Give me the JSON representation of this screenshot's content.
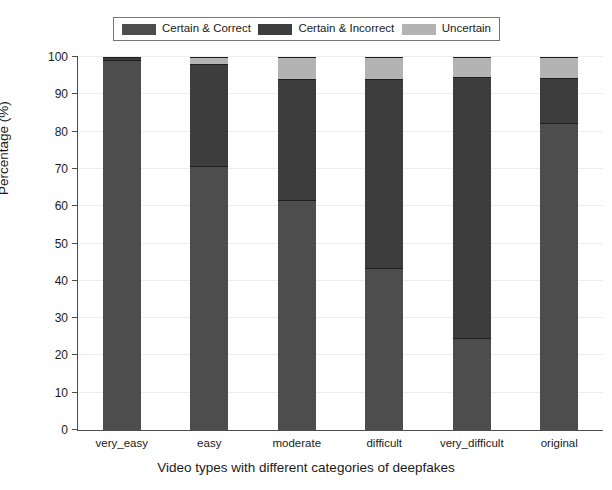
{
  "chart_data": {
    "type": "bar",
    "bar_mode": "stacked",
    "title": "",
    "xlabel": "Video types with different categories of deepfakes",
    "ylabel": "Percentage (%)",
    "categories": [
      "very_easy",
      "easy",
      "moderate",
      "difficult",
      "very_difficult",
      "original"
    ],
    "series": [
      {
        "name": "Certain & Correct",
        "color": "#4d4d4d",
        "values": [
          99.3,
          70.8,
          61.8,
          43.4,
          24.7,
          82.3
        ]
      },
      {
        "name": "Certain & Incorrect",
        "color": "#3d3d3d",
        "values": [
          0.7,
          27.3,
          32.4,
          50.8,
          69.9,
          12.0
        ]
      },
      {
        "name": "Uncertain",
        "color": "#b3b3b3",
        "values": [
          0.0,
          1.9,
          5.8,
          5.8,
          5.4,
          5.7
        ]
      }
    ],
    "ylim": [
      0,
      100
    ],
    "yticks": [
      0,
      10,
      20,
      30,
      40,
      50,
      60,
      70,
      80,
      90,
      100
    ],
    "ytick_labels": [
      "0",
      "10",
      "20",
      "30",
      "40",
      "50",
      "60",
      "70",
      "80",
      "90",
      "100"
    ],
    "grid": true,
    "grid_axis": "y",
    "legend_position": "upper center",
    "legend_entries": [
      {
        "label": "Certain & Correct",
        "color": "#4d4d4d"
      },
      {
        "label": "Certain & Incorrect",
        "color": "#3d3d3d"
      },
      {
        "label": "Uncertain",
        "color": "#b3b3b3"
      }
    ]
  },
  "colors": {
    "certain_correct": "#4d4d4d",
    "certain_incorrect": "#3d3d3d",
    "uncertain": "#b3b3b3",
    "axis": "#4d4d4d",
    "grid": "#ededed",
    "background": "#ffffff"
  }
}
